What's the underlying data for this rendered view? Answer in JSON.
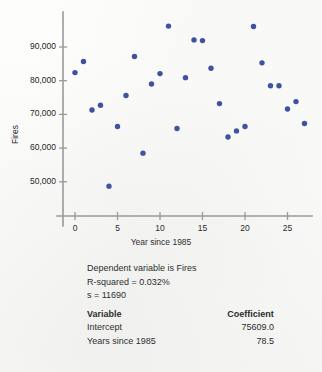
{
  "chart_data": {
    "type": "scatter",
    "title": "",
    "xlabel": "Year since 1985",
    "ylabel": "Fires",
    "xlim": [
      -1.5,
      28.5
    ],
    "ylim": [
      46500,
      98000
    ],
    "xticks": [
      0,
      5,
      10,
      15,
      20,
      25
    ],
    "xtick_labels": [
      "0",
      "5",
      "10",
      "15",
      "20",
      "25"
    ],
    "yticks": [
      50000,
      60000,
      70000,
      80000,
      90000
    ],
    "ytick_labels": [
      "50,000",
      "60,000",
      "70,000",
      "80,000",
      "90,000"
    ],
    "grid": false,
    "legend": null,
    "marker_color": "#3b4fa0",
    "axis_color": "#9a9a9a",
    "points": [
      {
        "x": 0,
        "y": 82400
      },
      {
        "x": 1,
        "y": 85700
      },
      {
        "x": 2,
        "y": 71300
      },
      {
        "x": 3,
        "y": 72700
      },
      {
        "x": 4,
        "y": 48700
      },
      {
        "x": 5,
        "y": 66400
      },
      {
        "x": 6,
        "y": 75600
      },
      {
        "x": 7,
        "y": 87200
      },
      {
        "x": 8,
        "y": 58500
      },
      {
        "x": 9,
        "y": 79000
      },
      {
        "x": 10,
        "y": 82100
      },
      {
        "x": 11,
        "y": 96200
      },
      {
        "x": 12,
        "y": 65800
      },
      {
        "x": 13,
        "y": 80900
      },
      {
        "x": 14,
        "y": 92100
      },
      {
        "x": 15,
        "y": 91900
      },
      {
        "x": 16,
        "y": 83700
      },
      {
        "x": 17,
        "y": 73200
      },
      {
        "x": 18,
        "y": 63300
      },
      {
        "x": 19,
        "y": 65100
      },
      {
        "x": 20,
        "y": 66400
      },
      {
        "x": 21,
        "y": 96100
      },
      {
        "x": 22,
        "y": 85300
      },
      {
        "x": 23,
        "y": 78500
      },
      {
        "x": 24,
        "y": 78500
      },
      {
        "x": 25,
        "y": 71600
      },
      {
        "x": 26,
        "y": 73800
      },
      {
        "x": 27,
        "y": 67300
      }
    ]
  },
  "regression": {
    "dependent_line": "Dependent variable is Fires",
    "r_squared_line": "R-squared  =  0.032%",
    "s_line": "s  =  11690",
    "table": {
      "headers": [
        "Variable",
        "Coefficient"
      ],
      "rows": [
        {
          "variable": "Intercept",
          "coefficient": "75609.0"
        },
        {
          "variable": "Years since 1985",
          "coefficient": "78.5"
        }
      ]
    }
  }
}
